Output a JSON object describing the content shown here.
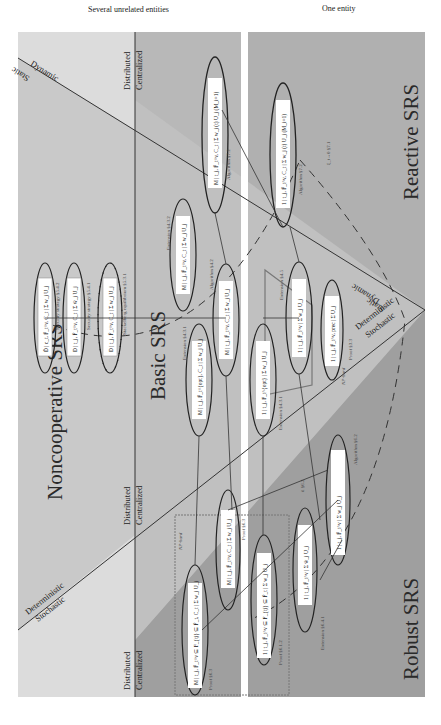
{
  "headers": {
    "left": "Several unrelated entities",
    "right": "One entity"
  },
  "regions": {
    "noncooperative": "Noncooperative SRS",
    "basic": "Basic SRS",
    "reactive": "Reactive SRS",
    "robust": "Robust SRS"
  },
  "axes": {
    "static": "Static",
    "dynamic": "Dynamic",
    "deterministic": "Deterministic",
    "stochastic": "Stochastic",
    "distributed": "Distributed",
    "centralized": "Centralized"
  },
  "nodes": [
    {
      "id": "nc1",
      "formula": "D̃ | c_t, F̄_t^v, C_t | Σ w_j U_j",
      "label": "Security strategy §5.4.2"
    },
    {
      "id": "nc2",
      "formula": "D | t_j, F̄_t^v, C_t | Σ w̄_j U_j",
      "label": "Security strategy §5.4.1"
    },
    {
      "id": "nc3",
      "formula": "D | t_j, F̄_t^v, C_t | Σ w_j U_j",
      "label": "Stackelberg equilibrium §5.3.1"
    },
    {
      "id": "b1",
      "formula": "M | t_j, F̄_t^v, C_t | Σ w_j U_j",
      "label": "Extension §4.3.2"
    },
    {
      "id": "b2",
      "formula": "M | t_j, F̄_t^v, C_t | Σ w_j U_j",
      "label": "Algorithm §4.2"
    },
    {
      "id": "b3",
      "formula": "M | t_j, F̄_t^{opt}, C_t | Σ w_j U_j",
      "label": "Extension §4.3.1"
    },
    {
      "id": "b4",
      "formula": "1 | t_j, F̄_t^v | Σ w_j U_j",
      "label": "Extension §4.5"
    },
    {
      "id": "b5",
      "formula": "1 | t_j, F_t^{opt} | Σ w_j U_j",
      "label": "Extension §4.3.1"
    },
    {
      "id": "b6",
      "formula": "1 | t_j, F̄_t^v, prec | Σ U_j",
      "label": "Proof §3.3"
    },
    {
      "id": "r1",
      "formula": "M | t_j, F̄_t^v, C_t | Σ w_j (t) U_j  (M_i=1)",
      "label": "Algorithm §7.2"
    },
    {
      "id": "r2",
      "formula": "1 | t_j, F̄_t^v, C_t | Σ w_j (t) U_j  (M_i=1)",
      "label": "Algorithm §7.2"
    },
    {
      "id": "rb1",
      "formula": "M | t_j, F̄_t^v ⊆ F_{tj} ⊆ F̄_t, C_t | Σ w_j U_j",
      "label": "Proof §6.3"
    },
    {
      "id": "rb2",
      "formula": "M | t_j, F̄_t^v, C_t | Σ w_j U_j",
      "label": "Proof §6.3"
    },
    {
      "id": "rb3",
      "formula": "1 | t_j, F̄_t^v ⊆ F_{tj} ⊆ F̄_t | Σ w_j U_j",
      "label": "Proof §6.1.2"
    },
    {
      "id": "rb4",
      "formula": "1 | t_j, F̄_t^v | Σ w̄_j U_j",
      "label": "Extension §6.4.1"
    },
    {
      "id": "rb5",
      "formula": "1 | t_j, F̄_t^v | Σ w_j U_j",
      "label": "Algorithm §6.2"
    }
  ],
  "annotations": {
    "np_hard_1": "NP-hard",
    "np_hard_2": "NP-hard",
    "reactive_limit": "ξ_t→0  §7.1",
    "robust_limit": "ū  §6.2"
  },
  "colors": {
    "light_region": "#d9d9d9",
    "mid_region": "#c2c2c2",
    "dark_region": "#a9a9a9",
    "stochastic_region": "#9a9a9a",
    "line": "#333333",
    "box_fill": "#ffffff"
  }
}
